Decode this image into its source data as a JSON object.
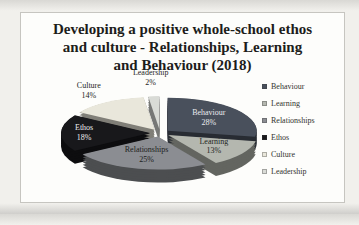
{
  "chart_data": {
    "type": "pie",
    "style": "3d-exploded",
    "title": "Developing a positive whole-school ethos and culture - Relationships, Learning and Behaviour (2018)",
    "legend_position": "right",
    "slices": [
      {
        "label": "Behaviour",
        "value": 28,
        "pct_label": "28%",
        "color": "#49505c",
        "label_color": "#e9ebee",
        "label_inside": true,
        "label_r": 0.6
      },
      {
        "label": "Learning",
        "value": 13,
        "pct_label": "13%",
        "color": "#b4b7af",
        "label_color": "#23261f",
        "label_inside": true,
        "label_r": 0.62
      },
      {
        "label": "Relationships",
        "value": 25,
        "pct_label": "25%",
        "color": "#8b8d92",
        "label_color": "#1c1d20",
        "label_inside": true,
        "label_r": 0.58
      },
      {
        "label": "Ethos",
        "value": 18,
        "pct_label": "18%",
        "color": "#18181b",
        "label_color": "#ececee",
        "label_inside": true,
        "label_r": 0.74
      },
      {
        "label": "Culture",
        "value": 14,
        "pct_label": "14%",
        "color": "#e9e7db",
        "label_color": "#26261f",
        "label_inside": false,
        "label_r": 1.38
      },
      {
        "label": "Leadership",
        "value": 2,
        "pct_label": "2%",
        "color": "#d9dbd6",
        "label_color": "#26261f",
        "label_inside": false,
        "label_r": 1.55
      }
    ]
  }
}
